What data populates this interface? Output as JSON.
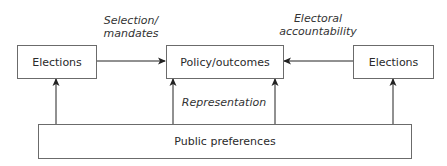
{
  "diagram": {
    "nodes": {
      "elections_left": "Elections",
      "policy": "Policy/outcomes",
      "elections_right": "Elections",
      "public": "Public preferences"
    },
    "edge_labels": {
      "selection_line1": "Selection/",
      "selection_line2": "mandates",
      "accountability_line1": "Electoral",
      "accountability_line2": "accountability",
      "representation": "Representation"
    },
    "edges": [
      {
        "from": "elections_left",
        "to": "policy",
        "label": "Selection/ mandates"
      },
      {
        "from": "elections_right",
        "to": "policy",
        "label": "Electoral accountability"
      },
      {
        "from": "public",
        "to": "elections_left"
      },
      {
        "from": "public",
        "to": "policy",
        "label": "Representation"
      },
      {
        "from": "public",
        "to": "policy"
      },
      {
        "from": "public",
        "to": "elections_right"
      }
    ],
    "colors": {
      "line": "#222222",
      "border": "#6b6b6b",
      "text": "#2a2a2a"
    }
  }
}
